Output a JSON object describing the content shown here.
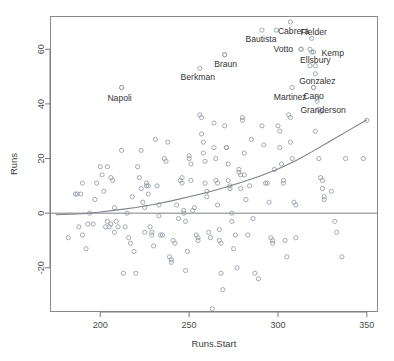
{
  "chart_data": {
    "type": "scatter",
    "title": "",
    "xlabel": "Runs.Start",
    "ylabel": "Runs",
    "xlim": [
      172,
      356
    ],
    "ylim": [
      -36,
      72
    ],
    "xticks": [
      200,
      250,
      300,
      350
    ],
    "yticks": [
      -20,
      0,
      20,
      40,
      60
    ],
    "grid": false,
    "legend": "none",
    "zero_reference_line": 0,
    "marker": "open-circle",
    "points": [
      {
        "x": 182,
        "y": -9
      },
      {
        "x": 186,
        "y": 7
      },
      {
        "x": 187,
        "y": 7
      },
      {
        "x": 189,
        "y": 7
      },
      {
        "x": 190,
        "y": 11
      },
      {
        "x": 188,
        "y": -5
      },
      {
        "x": 190,
        "y": -8
      },
      {
        "x": 192,
        "y": -13
      },
      {
        "x": 193,
        "y": -4
      },
      {
        "x": 194,
        "y": 0
      },
      {
        "x": 196,
        "y": -4
      },
      {
        "x": 197,
        "y": 5
      },
      {
        "x": 198,
        "y": 11
      },
      {
        "x": 200,
        "y": 17
      },
      {
        "x": 201,
        "y": 14
      },
      {
        "x": 202,
        "y": 8
      },
      {
        "x": 203,
        "y": -5
      },
      {
        "x": 204,
        "y": -3
      },
      {
        "x": 205,
        "y": -5
      },
      {
        "x": 206,
        "y": -4
      },
      {
        "x": 204,
        "y": 17
      },
      {
        "x": 206,
        "y": 13
      },
      {
        "x": 207,
        "y": 12
      },
      {
        "x": 208,
        "y": 2
      },
      {
        "x": 209,
        "y": -3
      },
      {
        "x": 208,
        "y": -7
      },
      {
        "x": 210,
        "y": -5
      },
      {
        "x": 212,
        "y": 23
      },
      {
        "x": 212,
        "y": 46
      },
      {
        "x": 213,
        "y": -22
      },
      {
        "x": 214,
        "y": -5
      },
      {
        "x": 215,
        "y": 0
      },
      {
        "x": 216,
        "y": -9
      },
      {
        "x": 217,
        "y": -11
      },
      {
        "x": 218,
        "y": 6
      },
      {
        "x": 219,
        "y": -14
      },
      {
        "x": 220,
        "y": -22
      },
      {
        "x": 221,
        "y": 17
      },
      {
        "x": 222,
        "y": 13
      },
      {
        "x": 223,
        "y": 9
      },
      {
        "x": 223,
        "y": 23
      },
      {
        "x": 224,
        "y": 4
      },
      {
        "x": 225,
        "y": 2
      },
      {
        "x": 225,
        "y": -7
      },
      {
        "x": 226,
        "y": 10
      },
      {
        "x": 226,
        "y": 11
      },
      {
        "x": 227,
        "y": 10
      },
      {
        "x": 227,
        "y": 7
      },
      {
        "x": 228,
        "y": -5
      },
      {
        "x": 229,
        "y": -7
      },
      {
        "x": 229,
        "y": -8
      },
      {
        "x": 230,
        "y": -12
      },
      {
        "x": 231,
        "y": 27
      },
      {
        "x": 232,
        "y": 10
      },
      {
        "x": 233,
        "y": 3
      },
      {
        "x": 233,
        "y": -1
      },
      {
        "x": 234,
        "y": -8
      },
      {
        "x": 235,
        "y": -8
      },
      {
        "x": 236,
        "y": 20
      },
      {
        "x": 237,
        "y": 19
      },
      {
        "x": 238,
        "y": 26
      },
      {
        "x": 239,
        "y": -16
      },
      {
        "x": 240,
        "y": -18
      },
      {
        "x": 240,
        "y": -17
      },
      {
        "x": 241,
        "y": -10
      },
      {
        "x": 242,
        "y": -11
      },
      {
        "x": 243,
        "y": 3
      },
      {
        "x": 244,
        "y": -2
      },
      {
        "x": 245,
        "y": 12
      },
      {
        "x": 246,
        "y": 13
      },
      {
        "x": 246,
        "y": 11
      },
      {
        "x": 247,
        "y": 1
      },
      {
        "x": 247,
        "y": 0
      },
      {
        "x": 248,
        "y": -3
      },
      {
        "x": 248,
        "y": -21
      },
      {
        "x": 249,
        "y": -14
      },
      {
        "x": 250,
        "y": 21
      },
      {
        "x": 250,
        "y": 20
      },
      {
        "x": 251,
        "y": 18
      },
      {
        "x": 251,
        "y": 12
      },
      {
        "x": 252,
        "y": 1
      },
      {
        "x": 253,
        "y": 2
      },
      {
        "x": 254,
        "y": -8
      },
      {
        "x": 255,
        "y": -10
      },
      {
        "x": 255,
        "y": -9
      },
      {
        "x": 256,
        "y": 36
      },
      {
        "x": 257,
        "y": 35
      },
      {
        "x": 257,
        "y": 29
      },
      {
        "x": 258,
        "y": 26
      },
      {
        "x": 258,
        "y": 22
      },
      {
        "x": 259,
        "y": 19
      },
      {
        "x": 259,
        "y": 11
      },
      {
        "x": 260,
        "y": 8
      },
      {
        "x": 260,
        "y": 6
      },
      {
        "x": 261,
        "y": -7
      },
      {
        "x": 262,
        "y": -9
      },
      {
        "x": 263,
        "y": -35
      },
      {
        "x": 264,
        "y": 33
      },
      {
        "x": 264,
        "y": 24
      },
      {
        "x": 265,
        "y": 20
      },
      {
        "x": 265,
        "y": 12
      },
      {
        "x": 266,
        "y": 11
      },
      {
        "x": 266,
        "y": 3
      },
      {
        "x": 267,
        "y": -6
      },
      {
        "x": 267,
        "y": -10
      },
      {
        "x": 268,
        "y": -11
      },
      {
        "x": 268,
        "y": -22
      },
      {
        "x": 269,
        "y": -28
      },
      {
        "x": 270,
        "y": 58
      },
      {
        "x": 270,
        "y": 32
      },
      {
        "x": 271,
        "y": 24
      },
      {
        "x": 271,
        "y": 24
      },
      {
        "x": 272,
        "y": 18
      },
      {
        "x": 272,
        "y": 12
      },
      {
        "x": 273,
        "y": 10
      },
      {
        "x": 273,
        "y": 9
      },
      {
        "x": 274,
        "y": 0
      },
      {
        "x": 274,
        "y": -3
      },
      {
        "x": 275,
        "y": -13
      },
      {
        "x": 276,
        "y": -8
      },
      {
        "x": 277,
        "y": -20
      },
      {
        "x": 278,
        "y": 16
      },
      {
        "x": 278,
        "y": 15
      },
      {
        "x": 279,
        "y": 14
      },
      {
        "x": 279,
        "y": 9
      },
      {
        "x": 280,
        "y": 35
      },
      {
        "x": 280,
        "y": 34
      },
      {
        "x": 281,
        "y": 22
      },
      {
        "x": 281,
        "y": 14
      },
      {
        "x": 282,
        "y": 5
      },
      {
        "x": 283,
        "y": -8
      },
      {
        "x": 284,
        "y": 10
      },
      {
        "x": 285,
        "y": 27
      },
      {
        "x": 286,
        "y": -2
      },
      {
        "x": 287,
        "y": -22
      },
      {
        "x": 289,
        "y": -24
      },
      {
        "x": 291,
        "y": 32
      },
      {
        "x": 292,
        "y": 25
      },
      {
        "x": 293,
        "y": 11
      },
      {
        "x": 294,
        "y": 11
      },
      {
        "x": 295,
        "y": 4
      },
      {
        "x": 296,
        "y": -9
      },
      {
        "x": 297,
        "y": -10
      },
      {
        "x": 297,
        "y": -11
      },
      {
        "x": 298,
        "y": 16
      },
      {
        "x": 299,
        "y": 67
      },
      {
        "x": 300,
        "y": 32
      },
      {
        "x": 301,
        "y": 30
      },
      {
        "x": 301,
        "y": 24
      },
      {
        "x": 302,
        "y": 18
      },
      {
        "x": 303,
        "y": 12
      },
      {
        "x": 303,
        "y": 11
      },
      {
        "x": 304,
        "y": -10
      },
      {
        "x": 305,
        "y": -16
      },
      {
        "x": 306,
        "y": 36
      },
      {
        "x": 307,
        "y": 35
      },
      {
        "x": 307,
        "y": 26
      },
      {
        "x": 308,
        "y": 20
      },
      {
        "x": 309,
        "y": 4
      },
      {
        "x": 310,
        "y": 3
      },
      {
        "x": 310,
        "y": -9
      },
      {
        "x": 313,
        "y": 60
      },
      {
        "x": 318,
        "y": 60
      },
      {
        "x": 319,
        "y": 59
      },
      {
        "x": 318,
        "y": 54
      },
      {
        "x": 320,
        "y": 46
      },
      {
        "x": 321,
        "y": 30
      },
      {
        "x": 322,
        "y": 42
      },
      {
        "x": 323,
        "y": 38
      },
      {
        "x": 324,
        "y": 37
      },
      {
        "x": 323,
        "y": 20
      },
      {
        "x": 324,
        "y": 13
      },
      {
        "x": 325,
        "y": 12
      },
      {
        "x": 325,
        "y": 9
      },
      {
        "x": 326,
        "y": 6
      },
      {
        "x": 326,
        "y": 5
      },
      {
        "x": 330,
        "y": 8
      },
      {
        "x": 332,
        "y": -3
      },
      {
        "x": 333,
        "y": -7
      },
      {
        "x": 336,
        "y": -16
      },
      {
        "x": 338,
        "y": 20
      },
      {
        "x": 348,
        "y": 20
      },
      {
        "x": 350,
        "y": 34
      }
    ],
    "trend_curve": [
      {
        "x": 175,
        "y": -0.6
      },
      {
        "x": 190,
        "y": -0.2
      },
      {
        "x": 200,
        "y": 0.4
      },
      {
        "x": 210,
        "y": 1.2
      },
      {
        "x": 220,
        "y": 2.1
      },
      {
        "x": 230,
        "y": 3.2
      },
      {
        "x": 240,
        "y": 4.5
      },
      {
        "x": 250,
        "y": 6.0
      },
      {
        "x": 260,
        "y": 7.6
      },
      {
        "x": 270,
        "y": 9.4
      },
      {
        "x": 280,
        "y": 11.4
      },
      {
        "x": 290,
        "y": 13.6
      },
      {
        "x": 300,
        "y": 16.2
      },
      {
        "x": 310,
        "y": 19.2
      },
      {
        "x": 320,
        "y": 22.8
      },
      {
        "x": 330,
        "y": 26.6
      },
      {
        "x": 340,
        "y": 30.4
      },
      {
        "x": 350,
        "y": 34.2
      }
    ],
    "labeled_points": [
      {
        "name": "Napoli",
        "x": 212,
        "y": 46,
        "label_dx": -2,
        "label_dy": 13,
        "anchor": "middle"
      },
      {
        "name": "Berkman",
        "x": 256,
        "y": 53,
        "label_dx": -2,
        "label_dy": 12,
        "anchor": "middle"
      },
      {
        "name": "Braun",
        "x": 270,
        "y": 58,
        "label_dx": 1,
        "label_dy": 12,
        "anchor": "middle"
      },
      {
        "name": "Bautista",
        "x": 291,
        "y": 67,
        "label_dx": -1,
        "label_dy": 12,
        "anchor": "middle"
      },
      {
        "name": "Cabrera",
        "x": 307,
        "y": 70,
        "label_dx": 3,
        "label_dy": 12,
        "anchor": "middle"
      },
      {
        "name": "Votto",
        "x": 313,
        "y": 60,
        "label_dx": -8,
        "label_dy": 3,
        "anchor": "end"
      },
      {
        "name": "Fielder",
        "x": 319,
        "y": 64,
        "label_dx": 2,
        "label_dy": -3,
        "anchor": "middle"
      },
      {
        "name": "Kemp",
        "x": 320,
        "y": 59,
        "label_dx": 8,
        "label_dy": 4,
        "anchor": "start"
      },
      {
        "name": "Ellsbury",
        "x": 321,
        "y": 54,
        "label_dx": 0,
        "label_dy": -3,
        "anchor": "middle"
      },
      {
        "name": "Gonzalez",
        "x": 321,
        "y": 51,
        "label_dx": 2,
        "label_dy": 10,
        "anchor": "middle"
      },
      {
        "name": "Martinez",
        "x": 308,
        "y": 46,
        "label_dx": -2,
        "label_dy": 12,
        "anchor": "middle"
      },
      {
        "name": "Cano",
        "x": 320,
        "y": 46,
        "label_dx": 0,
        "label_dy": 11,
        "anchor": "middle"
      },
      {
        "name": "Granderson",
        "x": 322,
        "y": 41,
        "label_dx": 6,
        "label_dy": 12,
        "anchor": "middle"
      }
    ]
  }
}
